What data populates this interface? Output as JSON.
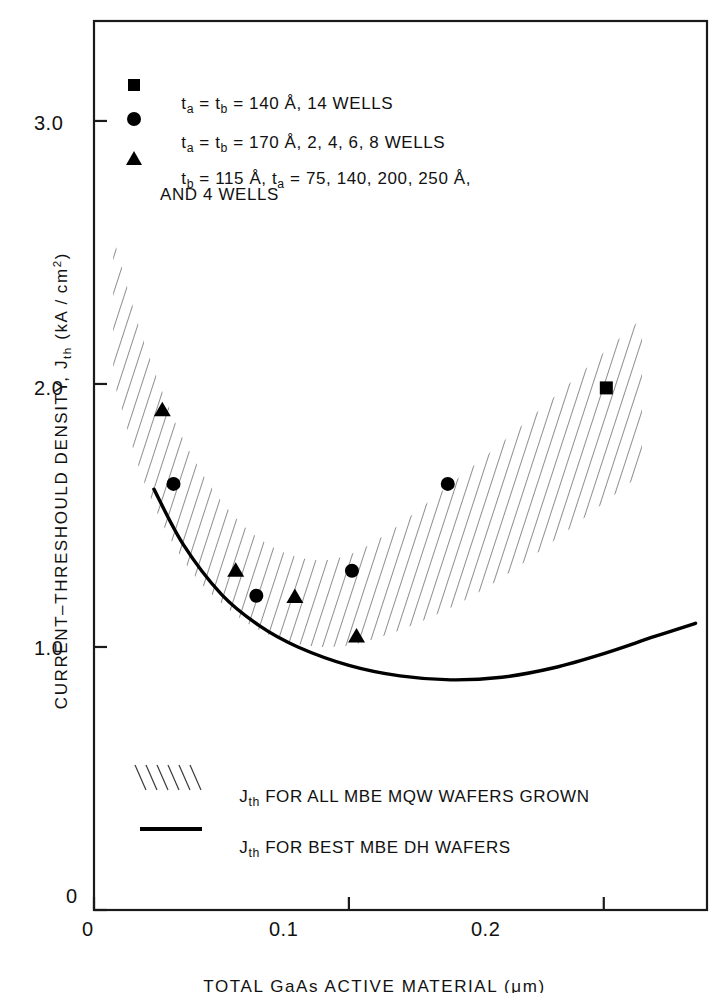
{
  "chart_data": {
    "type": "scatter",
    "title": "",
    "xlabel": "TOTAL GaAs ACTIVE MATERIAL (μm)",
    "ylabel": "CURRENT–THRESHOULD DENSITY, Jth (kA/cm2)",
    "xlim": [
      0,
      0.2405
    ],
    "ylim": [
      0,
      3.38
    ],
    "xticks": [
      0,
      0.1,
      0.2
    ],
    "xticklabels": [
      "0",
      "0.1",
      "0.2"
    ],
    "yticks": [
      0,
      1.0,
      2.0,
      3.0
    ],
    "yticklabels": [
      "0",
      "1.0",
      "2.0",
      "3.0"
    ],
    "grid": false,
    "legend_position": "upper-left and lower-left inside axes",
    "series": [
      {
        "name": "ta = tb = 140 A, 14 WELLS",
        "marker": "square",
        "points": [
          {
            "x": 0.201,
            "y": 1.985
          }
        ]
      },
      {
        "name": "ta = tb = 170 A, 2, 4, 6, 8 WELLS",
        "marker": "circle",
        "points": [
          {
            "x": 0.0312,
            "y": 1.62
          },
          {
            "x": 0.0637,
            "y": 1.195
          },
          {
            "x": 0.1012,
            "y": 1.29
          },
          {
            "x": 0.1388,
            "y": 1.62
          }
        ]
      },
      {
        "name": "tb = 115 A, ta = 75, 140, 200, 250 A, AND 4 WELLS",
        "marker": "triangle",
        "points": [
          {
            "x": 0.0268,
            "y": 1.9
          },
          {
            "x": 0.0556,
            "y": 1.29
          },
          {
            "x": 0.0788,
            "y": 1.19
          },
          {
            "x": 0.103,
            "y": 1.04
          }
        ]
      },
      {
        "name": "Jth FOR ALL MBE MQW WAFERS GROWN",
        "marker": "hatched-band",
        "band_upper": [
          {
            "x": 0.0075,
            "y": 2.56
          },
          {
            "x": 0.02,
            "y": 2.15
          },
          {
            "x": 0.035,
            "y": 1.79
          },
          {
            "x": 0.052,
            "y": 1.53
          },
          {
            "x": 0.07,
            "y": 1.38
          },
          {
            "x": 0.09,
            "y": 1.33
          },
          {
            "x": 0.11,
            "y": 1.4
          },
          {
            "x": 0.14,
            "y": 1.62
          },
          {
            "x": 0.17,
            "y": 1.86
          },
          {
            "x": 0.215,
            "y": 2.25
          }
        ],
        "band_lower": [
          {
            "x": 0.0075,
            "y": 2.02
          },
          {
            "x": 0.02,
            "y": 1.62
          },
          {
            "x": 0.035,
            "y": 1.33
          },
          {
            "x": 0.052,
            "y": 1.15
          },
          {
            "x": 0.07,
            "y": 1.04
          },
          {
            "x": 0.09,
            "y": 1.0
          },
          {
            "x": 0.11,
            "y": 1.03
          },
          {
            "x": 0.14,
            "y": 1.15
          },
          {
            "x": 0.17,
            "y": 1.33
          },
          {
            "x": 0.215,
            "y": 1.66
          }
        ]
      },
      {
        "name": "Jth FOR BEST MBE DH WAFERS",
        "marker": "solid-line",
        "points": [
          {
            "x": 0.0235,
            "y": 1.6
          },
          {
            "x": 0.035,
            "y": 1.39
          },
          {
            "x": 0.05,
            "y": 1.2
          },
          {
            "x": 0.065,
            "y": 1.08
          },
          {
            "x": 0.08,
            "y": 1.0
          },
          {
            "x": 0.1,
            "y": 0.93
          },
          {
            "x": 0.12,
            "y": 0.89
          },
          {
            "x": 0.14,
            "y": 0.875
          },
          {
            "x": 0.16,
            "y": 0.885
          },
          {
            "x": 0.18,
            "y": 0.92
          },
          {
            "x": 0.2,
            "y": 0.975
          },
          {
            "x": 0.22,
            "y": 1.04
          },
          {
            "x": 0.236,
            "y": 1.09
          }
        ]
      }
    ]
  },
  "axes": {
    "ylabel_parts": {
      "main": "CURRENT–THRESHOULD DENSITY, J",
      "sub": "th",
      "units_open": "  (kA / cm",
      "units_exp": "2",
      "units_close": ")"
    },
    "xlabel": "TOTAL GaAs ACTIVE MATERIAL (μm)",
    "xticklabels": [
      "0",
      "0.1",
      "0.2"
    ],
    "yticklabels": [
      "0",
      "1.0",
      "2.0",
      "3.0"
    ]
  },
  "marker_legend": {
    "rows": [
      {
        "marker": "square",
        "line1": "tₐ = tᵇ = 140 Å, 14 WELLS",
        "text_main": "t",
        "sub_a": "a",
        "mid": " = t",
        "sub_b": "b",
        "tail": " = 140 Å, 14 WELLS"
      },
      {
        "marker": "circle",
        "line1": "tₐ = tᵇ = 170 Å, 2, 4, 6, 8 WELLS",
        "text_main": "t",
        "sub_a": "a",
        "mid": " = t",
        "sub_b": "b",
        "tail": " = 170 Å, 2, 4, 6, 8 WELLS"
      },
      {
        "marker": "triangle",
        "line1": "tᵇ = 115 Å, tₐ = 75, 140, 200, 250 Å,",
        "text_main": "t",
        "sub_a": "b",
        "mid": " = 115 Å, t",
        "sub_b": "a",
        "tail": " = 75, 140, 200, 250 Å,"
      }
    ],
    "continuation": "AND 4 WELLS"
  },
  "band_legend": {
    "rows": [
      {
        "swatch": "hatch",
        "j": "J",
        "sub": "th",
        "text": " FOR ALL MBE MQW WAFERS GROWN"
      },
      {
        "swatch": "line",
        "j": "J",
        "sub": "th",
        "text": " FOR BEST MBE DH WAFERS"
      }
    ]
  }
}
